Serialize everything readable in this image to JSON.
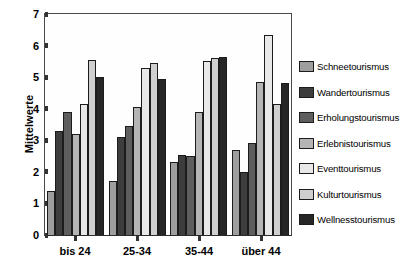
{
  "chart_data": {
    "type": "bar",
    "title": "",
    "subtitle": "",
    "xlabel": "",
    "ylabel": "Mittelwerte",
    "ylim": [
      0,
      7
    ],
    "yticks": [
      0,
      1,
      2,
      3,
      4,
      5,
      6,
      7
    ],
    "grid": false,
    "legend_position": "right",
    "categories": [
      "bis 24",
      "25-34",
      "35-44",
      "über 44"
    ],
    "series": [
      {
        "name": "Schneetourismus",
        "color": "#9e9e9e",
        "values": [
          1.4,
          1.7,
          2.3,
          2.7
        ]
      },
      {
        "name": "Wandertourismus",
        "color": "#3d3d3d",
        "values": [
          3.3,
          3.1,
          2.55,
          2.0
        ]
      },
      {
        "name": "Erholungstourismus",
        "color": "#5e5e5e",
        "values": [
          3.9,
          3.45,
          2.5,
          2.9
        ]
      },
      {
        "name": "Erlebnistourismus",
        "color": "#b5b5b5",
        "values": [
          3.2,
          4.05,
          3.9,
          4.85
        ]
      },
      {
        "name": "Eventtourismus",
        "color": "#e8e8e8",
        "values": [
          4.15,
          5.3,
          5.5,
          6.35
        ]
      },
      {
        "name": "Kulturtourismus",
        "color": "#cfcfcf",
        "values": [
          5.55,
          5.45,
          5.6,
          4.15
        ]
      },
      {
        "name": "Wellnesstourismus",
        "color": "#262626",
        "values": [
          5.0,
          4.95,
          5.65,
          4.8
        ]
      }
    ]
  },
  "axis": {
    "y_title": "Mittelwerte",
    "y_ticks": [
      "7",
      "6",
      "5",
      "4",
      "3",
      "2",
      "1",
      "0"
    ],
    "x_ticks": [
      "bis 24",
      "25-34",
      "35-44",
      "über 44"
    ]
  },
  "legend": {
    "entries": [
      "Schneetourismus",
      "Wandertourismus",
      "Erholungstourismus",
      "Erlebnistourismus",
      "Eventtourismus",
      "Kulturtourismus",
      "Wellnesstourismus"
    ]
  }
}
